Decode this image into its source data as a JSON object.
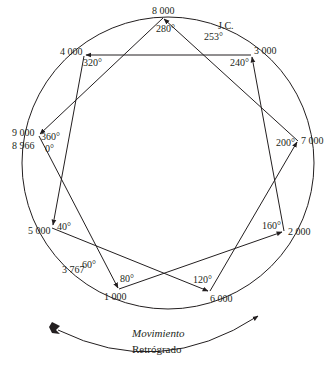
{
  "diagram": {
    "type": "enneagram-star-circle",
    "nodes": [
      {
        "id": "n8000",
        "label": "8 000",
        "angle": "280°",
        "x": 163,
        "y": 18
      },
      {
        "id": "n3000",
        "label": "3 000",
        "angle": "240°",
        "x": 252,
        "y": 56
      },
      {
        "id": "n7000",
        "label": "7 000",
        "angle": "200°",
        "x": 298,
        "y": 141
      },
      {
        "id": "n2000",
        "label": "2 000",
        "angle": "160°",
        "x": 284,
        "y": 231
      },
      {
        "id": "n6000",
        "label": "6 000",
        "angle": "120°",
        "x": 209,
        "y": 292
      },
      {
        "id": "n1000",
        "label": "1 000",
        "angle": "80°",
        "x": 118,
        "y": 289
      },
      {
        "id": "n5000",
        "label": "5 000",
        "angle": "40°",
        "x": 52,
        "y": 227
      },
      {
        "id": "n9000",
        "label": "9 000",
        "label2": "8 966",
        "angle": "360°",
        "angle2": "0°",
        "x": 39,
        "y": 135
      },
      {
        "id": "n4000",
        "label": "4 000",
        "angle": "320°",
        "x": 84,
        "y": 55
      }
    ],
    "extra_labels": {
      "jc": "J.C.",
      "jc_angle": "253°",
      "p3767": "3 767",
      "p3767_angle": "60°"
    },
    "edges": [
      {
        "from": "n7000",
        "to": "n8000"
      },
      {
        "from": "n8000",
        "to": "n9000"
      },
      {
        "from": "n3000",
        "to": "n4000"
      },
      {
        "from": "n4000",
        "to": "n5000"
      },
      {
        "from": "n9000",
        "to": "n1000"
      },
      {
        "from": "n5000",
        "to": "n6000"
      },
      {
        "from": "n1000",
        "to": "n2000"
      },
      {
        "from": "n6000",
        "to": "n7000"
      },
      {
        "from": "n2000",
        "to": "n3000"
      }
    ],
    "caption": {
      "line1": "Movimiento",
      "line2": "Retrógrado"
    },
    "colors": {
      "stroke": "#231f20",
      "background": "#ffffff"
    }
  }
}
